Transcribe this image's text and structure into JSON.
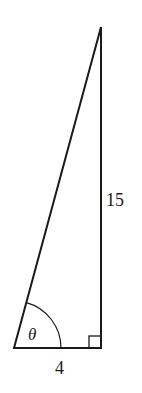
{
  "diagram": {
    "type": "right-triangle",
    "labels": {
      "angle": "θ",
      "base": "4",
      "height": "15"
    },
    "right_angle_marker": true,
    "stroke_color": "#1a1a1a",
    "background": "#ffffff"
  }
}
